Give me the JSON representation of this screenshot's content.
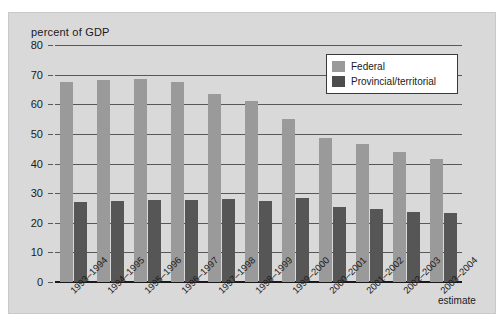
{
  "chart_data": {
    "type": "bar",
    "title": "",
    "ylabel": "percent of GDP",
    "xlabel": "",
    "ylim": [
      0,
      80
    ],
    "yticks": [
      0,
      10,
      20,
      30,
      40,
      50,
      60,
      70,
      80
    ],
    "grid": true,
    "legend_position": "top-right",
    "categories": [
      "1993–1994",
      "1994–1995",
      "1995–1996",
      "1996–1997",
      "1997–1998",
      "1998–1999",
      "1999–2000",
      "2000–2001",
      "2001–2002",
      "2002–2003",
      "2003–2004"
    ],
    "series": [
      {
        "name": "Federal",
        "color": "#9a9a9a",
        "values": [
          67.5,
          68.3,
          68.6,
          67.6,
          63.5,
          61.2,
          55.0,
          48.5,
          46.6,
          43.8,
          41.4
        ]
      },
      {
        "name": "Provincial/territorial",
        "color": "#565656",
        "values": [
          26.9,
          27.4,
          27.7,
          27.7,
          28.0,
          27.5,
          28.2,
          25.3,
          24.7,
          23.8,
          23.2
        ]
      }
    ],
    "annotations": [
      {
        "text": "estimate",
        "refers_to": "2003–2004"
      }
    ]
  },
  "legend": {
    "items": [
      {
        "label": "Federal",
        "swatch": "federal-swatch"
      },
      {
        "label": "Provincial/territorial",
        "swatch": "provincial-swatch"
      }
    ]
  },
  "axis": {
    "y_title": "percent of GDP",
    "y_tick_labels": [
      "0",
      "10",
      "20",
      "30",
      "40",
      "50",
      "60",
      "70",
      "80"
    ],
    "estimate_note": "estimate"
  },
  "colors": {
    "federal": "#9a9a9a",
    "provincial": "#565656",
    "plot_background": "#d9d9d9",
    "axis": "#1a1a1a",
    "gridline": "#585858"
  }
}
